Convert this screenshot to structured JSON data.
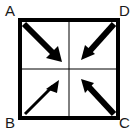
{
  "figure": {
    "background_color": "#ffffff",
    "stroke_color": "#000000",
    "label_color": "#1a1a1a",
    "width": 137,
    "height": 137
  },
  "square": {
    "name": "square-abcd",
    "left": 20,
    "top": 20,
    "right": 118,
    "bottom": 118,
    "border_width": 4,
    "grid": {
      "visible": true,
      "line_width": 1,
      "vertical_x": 69,
      "horizontal_y": 69
    }
  },
  "labels": [
    {
      "id": "A",
      "text": "A",
      "corner": "top-left",
      "x": 5,
      "y": 3
    },
    {
      "id": "D",
      "text": "D",
      "corner": "top-right",
      "x": 119,
      "y": 3
    },
    {
      "id": "B",
      "text": "B",
      "corner": "bottom-left",
      "x": 5,
      "y": 115
    },
    {
      "id": "C",
      "text": "C",
      "corner": "bottom-right",
      "x": 119,
      "y": 115
    }
  ],
  "arrows": [
    {
      "id": "arrow-from-a",
      "from_corner": "A",
      "direction": "down-right",
      "weight": "thick",
      "line_width": 6,
      "head_size": 11,
      "x1": 24,
      "y1": 24,
      "x2": 59,
      "y2": 59
    },
    {
      "id": "arrow-from-d",
      "from_corner": "D",
      "direction": "down-left",
      "weight": "thick",
      "line_width": 6,
      "head_size": 10,
      "x1": 114,
      "y1": 24,
      "x2": 85,
      "y2": 56
    },
    {
      "id": "arrow-from-b",
      "from_corner": "B",
      "direction": "up-right",
      "weight": "thin",
      "line_width": 3,
      "head_size": 9,
      "x1": 25,
      "y1": 114,
      "x2": 56,
      "y2": 83
    },
    {
      "id": "arrow-from-c",
      "from_corner": "C",
      "direction": "up-left",
      "weight": "thick",
      "line_width": 6,
      "head_size": 10,
      "x1": 114,
      "y1": 114,
      "x2": 84,
      "y2": 82
    }
  ]
}
